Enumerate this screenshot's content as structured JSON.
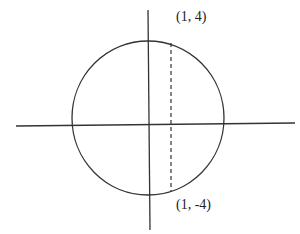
{
  "diagram": {
    "labels": {
      "top_point": "(1, 4)",
      "bottom_point": "(1, -4)"
    },
    "colors": {
      "stroke": "#333333",
      "background": "#ffffff"
    }
  }
}
